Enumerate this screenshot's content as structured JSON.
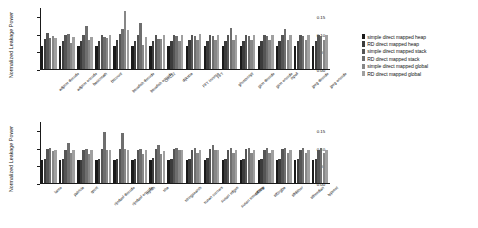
{
  "figure": {
    "ylabel": "Normalized Leakage Power"
  },
  "legend": {
    "position": "right",
    "items": [
      {
        "label": "simple direct mapped heap",
        "color": "#1a1a1a"
      },
      {
        "label": "RD direct mapped heap",
        "color": "#3c3c3c"
      },
      {
        "label": "simple direct mapped stack",
        "color": "#555555"
      },
      {
        "label": "RD direct mapped stack",
        "color": "#6e6e6e"
      },
      {
        "label": "simple direct mapped global",
        "color": "#878787"
      },
      {
        "label": "RD direct mapped global",
        "color": "#a0a0a0"
      }
    ]
  },
  "chart_data": [
    {
      "type": "bar",
      "title": "",
      "xlabel": "",
      "ylabel": "Normalized Leakage Power",
      "ylim": [
        0.0,
        0.175
      ],
      "yticks": [
        0.0,
        0.05,
        0.1,
        0.15
      ],
      "ytick_labels": [
        "0.00",
        "0.05",
        "0.10",
        "0.15"
      ],
      "grid": false,
      "legend_position": "right",
      "categories": [
        "adpcm decode",
        "adpcm encode",
        "basicmath",
        "bitcount",
        "blowfish decode",
        "blowfish encode",
        "CRC32",
        "dijkstra",
        "FFT inverse",
        "FFT",
        "ghostscript",
        "gsm decode",
        "gsm encode",
        "ispell",
        "jpeg decode",
        "jpeg encode"
      ],
      "series": [
        {
          "name": "simple direct mapped heap",
          "values": [
            0.065,
            0.065,
            0.065,
            0.065,
            0.065,
            0.065,
            0.065,
            0.065,
            0.065,
            0.065,
            0.065,
            0.065,
            0.065,
            0.065,
            0.065,
            0.065
          ]
        },
        {
          "name": "RD direct mapped heap",
          "values": [
            0.085,
            0.08,
            0.078,
            0.08,
            0.083,
            0.08,
            0.078,
            0.078,
            0.082,
            0.08,
            0.08,
            0.08,
            0.08,
            0.08,
            0.08,
            0.08
          ]
        },
        {
          "name": "simple direct mapped stack",
          "values": [
            0.103,
            0.095,
            0.097,
            0.097,
            0.098,
            0.097,
            0.095,
            0.096,
            0.096,
            0.096,
            0.097,
            0.096,
            0.096,
            0.097,
            0.097,
            0.096
          ]
        },
        {
          "name": "RD direct mapped stack",
          "values": [
            0.087,
            0.099,
            0.122,
            0.09,
            0.112,
            0.13,
            0.085,
            0.093,
            0.094,
            0.094,
            0.116,
            0.094,
            0.093,
            0.113,
            0.094,
            0.093
          ]
        },
        {
          "name": "simple direct mapped global",
          "values": [
            0.093,
            0.073,
            0.081,
            0.087,
            0.165,
            0.068,
            0.084,
            0.08,
            0.082,
            0.083,
            0.082,
            0.081,
            0.081,
            0.081,
            0.081,
            0.081
          ]
        },
        {
          "name": "RD direct mapped global",
          "values": [
            0.088,
            0.09,
            0.089,
            0.095,
            0.11,
            0.091,
            0.097,
            0.095,
            0.099,
            0.097,
            0.097,
            0.097,
            0.097,
            0.097,
            0.097,
            0.097
          ]
        }
      ]
    },
    {
      "type": "bar",
      "title": "",
      "xlabel": "",
      "ylabel": "Normalized Leakage Power",
      "ylim": [
        0.0,
        0.175
      ],
      "yticks": [
        0.0,
        0.05,
        0.1,
        0.15
      ],
      "ytick_labels": [
        "0.00",
        "0.05",
        "0.10",
        "0.15"
      ],
      "grid": false,
      "legend_position": "right",
      "categories": [
        "lame",
        "patricia",
        "qsort",
        "rijndael decode",
        "rijndael encode",
        "rsynth",
        "sha",
        "stringsearch",
        "susan corners",
        "susan edges",
        "susan smoothing",
        "tiff2bw",
        "tiff2rgba",
        "tiffdither",
        "tiffmedian",
        "typeset"
      ],
      "series": [
        {
          "name": "simple direct mapped heap",
          "values": [
            0.065,
            0.065,
            0.064,
            0.065,
            0.065,
            0.065,
            0.065,
            0.065,
            0.065,
            0.065,
            0.065,
            0.065,
            0.065,
            0.065,
            0.065,
            0.065
          ]
        },
        {
          "name": "RD direct mapped heap",
          "values": [
            0.068,
            0.068,
            0.066,
            0.068,
            0.067,
            0.068,
            0.072,
            0.067,
            0.068,
            0.072,
            0.068,
            0.068,
            0.068,
            0.068,
            0.068,
            0.068
          ]
        },
        {
          "name": "simple direct mapped stack",
          "values": [
            0.096,
            0.094,
            0.092,
            0.096,
            0.095,
            0.093,
            0.095,
            0.096,
            0.094,
            0.096,
            0.094,
            0.095,
            0.094,
            0.095,
            0.094,
            0.094
          ]
        },
        {
          "name": "RD direct mapped stack",
          "values": [
            0.098,
            0.113,
            0.096,
            0.145,
            0.142,
            0.097,
            0.106,
            0.1,
            0.099,
            0.106,
            0.099,
            0.1,
            0.099,
            0.1,
            0.099,
            0.099
          ]
        },
        {
          "name": "simple direct mapped global",
          "values": [
            0.09,
            0.085,
            0.082,
            0.092,
            0.096,
            0.083,
            0.082,
            0.094,
            0.085,
            0.094,
            0.085,
            0.086,
            0.085,
            0.086,
            0.085,
            0.085
          ]
        },
        {
          "name": "RD direct mapped global",
          "values": [
            0.092,
            0.093,
            0.094,
            0.093,
            0.093,
            0.093,
            0.09,
            0.093,
            0.092,
            0.093,
            0.092,
            0.093,
            0.092,
            0.093,
            0.092,
            0.092
          ]
        }
      ]
    }
  ]
}
